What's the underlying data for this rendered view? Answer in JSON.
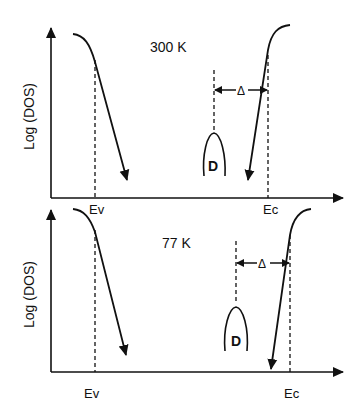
{
  "panels": [
    {
      "temperature_label": "300 K",
      "y_axis_label": "Log (DOS)",
      "ev_label": "Ev",
      "ec_label": "Ec",
      "defect_label": "D",
      "gap_label": "Δ"
    },
    {
      "temperature_label": "77 K",
      "y_axis_label": "Log (DOS)",
      "ev_label": "Ev",
      "ec_label": "Ec",
      "defect_label": "D",
      "gap_label": "Δ"
    }
  ],
  "colors": {
    "line": "#111111",
    "background": "#ffffff"
  }
}
